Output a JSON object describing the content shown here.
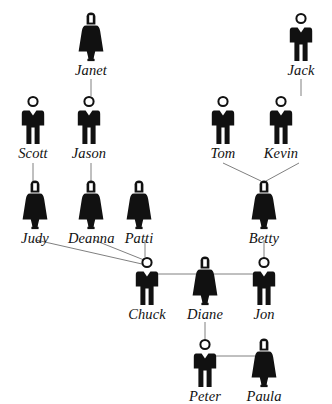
{
  "diagram": {
    "type": "family-tree",
    "background_color": "#ffffff",
    "figure_color": "#111111",
    "line_color": "#808080",
    "generations": [
      {
        "row": 1,
        "people": [
          {
            "id": "janet",
            "name": "Janet",
            "gender": "female",
            "x": 68,
            "y": 12
          },
          {
            "id": "jack",
            "name": "Jack",
            "gender": "male",
            "x": 278,
            "y": 12
          }
        ]
      },
      {
        "row": 2,
        "people": [
          {
            "id": "scott",
            "name": "Scott",
            "gender": "male",
            "x": 10,
            "y": 95
          },
          {
            "id": "jason",
            "name": "Jason",
            "gender": "male",
            "x": 66,
            "y": 95
          },
          {
            "id": "tom",
            "name": "Tom",
            "gender": "male",
            "x": 200,
            "y": 95
          },
          {
            "id": "kevin",
            "name": "Kevin",
            "gender": "male",
            "x": 258,
            "y": 95
          }
        ]
      },
      {
        "row": 3,
        "people": [
          {
            "id": "judy",
            "name": "Judy",
            "gender": "female",
            "x": 12,
            "y": 180
          },
          {
            "id": "deanna",
            "name": "Deanna",
            "gender": "female",
            "x": 68,
            "y": 180
          },
          {
            "id": "patti",
            "name": "Patti",
            "gender": "female",
            "x": 116,
            "y": 180
          },
          {
            "id": "betty",
            "name": "Betty",
            "gender": "female",
            "x": 241,
            "y": 180
          }
        ]
      },
      {
        "row": 4,
        "people": [
          {
            "id": "chuck",
            "name": "Chuck",
            "gender": "male",
            "x": 124,
            "y": 256
          },
          {
            "id": "diane",
            "name": "Diane",
            "gender": "female",
            "x": 182,
            "y": 256
          },
          {
            "id": "jon",
            "name": "Jon",
            "gender": "male",
            "x": 241,
            "y": 256
          }
        ]
      },
      {
        "row": 5,
        "people": [
          {
            "id": "peter",
            "name": "Peter",
            "gender": "male",
            "x": 182,
            "y": 338
          },
          {
            "id": "paula",
            "name": "Paula",
            "gender": "female",
            "x": 241,
            "y": 338
          }
        ]
      }
    ],
    "connections": [
      {
        "from": "janet",
        "to": "jason",
        "kind": "parent-child",
        "x1": 91,
        "y1": 79,
        "x2": 91,
        "y2": 96
      },
      {
        "from": "jack",
        "to": "kevin",
        "kind": "parent-child",
        "x1": 301,
        "y1": 79,
        "x2": 301,
        "y2": 96
      },
      {
        "from": "scott",
        "to": "judy",
        "kind": "parent-child",
        "x1": 33,
        "y1": 163,
        "x2": 33,
        "y2": 181
      },
      {
        "from": "jason",
        "to": "deanna",
        "kind": "parent-child",
        "x1": 91,
        "y1": 163,
        "x2": 91,
        "y2": 181
      },
      {
        "from": "tom",
        "to": "betty",
        "kind": "parent-child",
        "x1": 223,
        "y1": 163,
        "x2": 261,
        "y2": 181
      },
      {
        "from": "kevin",
        "to": "betty",
        "kind": "parent-child",
        "x1": 299,
        "y1": 163,
        "x2": 266,
        "y2": 181
      },
      {
        "from": "judy",
        "to": "chuck",
        "kind": "parent-child",
        "x1": 36,
        "y1": 240,
        "x2": 142,
        "y2": 264
      },
      {
        "from": "deanna",
        "to": "chuck",
        "kind": "parent-child",
        "x1": 94,
        "y1": 240,
        "x2": 144,
        "y2": 260
      },
      {
        "from": "patti",
        "to": "chuck",
        "kind": "parent-child",
        "x1": 145,
        "y1": 240,
        "x2": 145,
        "y2": 257
      },
      {
        "from": "betty",
        "to": "jon",
        "kind": "parent-child",
        "x1": 264,
        "y1": 240,
        "x2": 264,
        "y2": 257
      },
      {
        "from": "chuck",
        "to": "diane",
        "kind": "spouse",
        "x1": 155,
        "y1": 274,
        "x2": 196,
        "y2": 274
      },
      {
        "from": "diane",
        "to": "jon",
        "kind": "spouse",
        "x1": 214,
        "y1": 274,
        "x2": 255,
        "y2": 274
      },
      {
        "from": "diane",
        "to": "peter",
        "kind": "parent-child",
        "x1": 205,
        "y1": 322,
        "x2": 205,
        "y2": 339
      },
      {
        "from": "peter",
        "to": "paula",
        "kind": "spouse",
        "x1": 214,
        "y1": 356,
        "x2": 255,
        "y2": 356
      }
    ]
  }
}
